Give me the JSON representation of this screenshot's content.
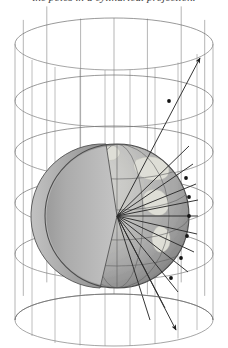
{
  "figure": {
    "caption": "the poles in a cylindrical projection."
  },
  "colors": {
    "background": "#ffffff",
    "wireframe_line": "#6e6e6e",
    "globe_outline": "#4a4a4a",
    "globe_ocean_light": "#c9c9c9",
    "globe_ocean_mid": "#a8a8a8",
    "globe_ocean_dark": "#8d8d8d",
    "globe_land": "#dcdcd4",
    "wedge_interior_light": "#b5b5b5",
    "wedge_interior_dark": "#7f7f7f",
    "graticule": "#6a6a6a",
    "ray_line": "#2b2b2b",
    "ray_node": "#1a1a1a",
    "caption_text": "#3a3a3a"
  },
  "geometry": {
    "canvas_width": 228,
    "canvas_height": 348,
    "cylinder": {
      "center_x": 114,
      "top_ellipse_cy": 44,
      "bottom_ellipse_cy": 320,
      "radius_x": 99,
      "radius_y": 26,
      "meridian_count": 12,
      "latitude_ring_cys": [
        44,
        101,
        152,
        203,
        254,
        320
      ]
    },
    "globe": {
      "center_x": 117,
      "center_y": 216,
      "radius": 72,
      "equator_cy": 216,
      "parallel_cys": [
        160,
        188,
        216,
        244,
        272
      ],
      "meridian_count": 7
    },
    "wedge": {
      "apex_x": 117,
      "apex_y": 216,
      "top_x": 106,
      "top_y": 144,
      "bottom_x": 100,
      "bottom_y": 288
    },
    "rays": {
      "origin_x": 117,
      "origin_y": 216,
      "count": 13,
      "surface_nodes": 6,
      "arrow_targets": [
        {
          "x": 200,
          "y": 58,
          "label": "upper-cylinder-arrow"
        },
        {
          "x": 176,
          "y": 330,
          "label": "lower-cylinder-arrow"
        }
      ]
    }
  },
  "labels": {
    "globe": "Earth globe",
    "cylinder": "Projection cylinder",
    "rays": "Projection rays from globe centre",
    "wedge": "Cut-away wedge"
  }
}
